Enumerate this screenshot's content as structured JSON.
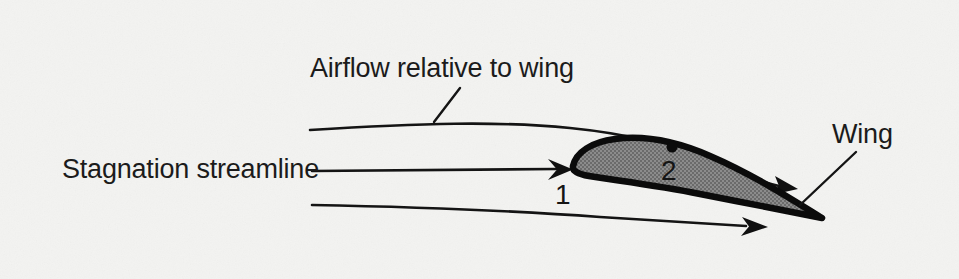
{
  "figure": {
    "kind": "airfoil-streamline-diagram",
    "background_color": "#f3f3f1",
    "ink_color": "#121212",
    "airfoil_fill_color": "#7d7d7d",
    "width": 959,
    "height": 279
  },
  "labels": {
    "airflow": "Airflow relative to wing",
    "stagnation": "Stagnation streamline",
    "wing": "Wing",
    "point_one": "1",
    "point_two": "2"
  },
  "elements": {
    "airfoil_name": "wing-cross-section",
    "upper_streamline_name": "upper-streamline",
    "stagnation_streamline_name": "stagnation-streamline",
    "lower_streamline_name": "lower-streamline",
    "stagnation_point_marker": "stagnation-point-1",
    "upper_surface_point_marker": "surface-point-2"
  }
}
